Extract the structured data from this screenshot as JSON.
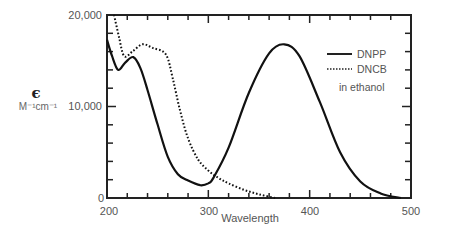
{
  "chart_data": {
    "type": "line",
    "title": "",
    "xlabel": "Wavelength",
    "ylabel": "ε",
    "ylabel_unit": "M⁻¹cm⁻¹",
    "xlim": [
      200,
      500
    ],
    "ylim": [
      0,
      20000
    ],
    "x_ticks": [
      200,
      300,
      400,
      500
    ],
    "x_tick_labels": [
      "200",
      "300",
      "400",
      "500"
    ],
    "y_ticks": [
      0,
      10000,
      20000
    ],
    "y_tick_labels": [
      "0",
      "10,000",
      "20,000"
    ],
    "grid": false,
    "legend_position": "upper right",
    "annotation": "in ethanol",
    "series": [
      {
        "name": "DNPP",
        "style": "solid",
        "x": [
          200,
          205,
          211,
          218,
          226,
          233,
          240,
          250,
          260,
          270,
          280,
          292,
          300,
          305,
          320,
          340,
          360,
          375,
          390,
          410,
          430,
          450,
          470,
          490
        ],
        "y": [
          17300,
          15500,
          14000,
          14800,
          15400,
          14200,
          11800,
          8000,
          4500,
          2600,
          1900,
          1400,
          1600,
          2200,
          5500,
          11500,
          15800,
          16800,
          15500,
          10500,
          5000,
          1800,
          500,
          0
        ]
      },
      {
        "name": "DNCB",
        "style": "dotted",
        "x": [
          207,
          212,
          217,
          225,
          235,
          245,
          258,
          265,
          272,
          280,
          290,
          300,
          310,
          320,
          335,
          350,
          366
        ],
        "y": [
          20000,
          17500,
          15500,
          16000,
          16800,
          16400,
          15700,
          13000,
          9600,
          6500,
          4200,
          3000,
          2200,
          1600,
          900,
          400,
          0
        ]
      }
    ]
  },
  "labels": {
    "y_symbol": "ϵ",
    "y_unit": "M⁻¹cm⁻¹",
    "x_title": "Wavelength",
    "legend_dnpp": "DNPP",
    "legend_dncb": "DNCB",
    "annotation": "in ethanol",
    "y0": "0",
    "y10000": "10,000",
    "y20000": "20,000",
    "x200": "200",
    "x300": "300",
    "x400": "400",
    "x500": "500"
  }
}
